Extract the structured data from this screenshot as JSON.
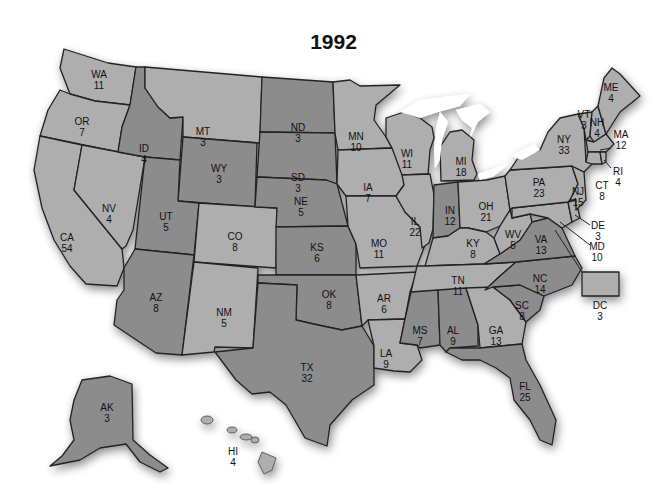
{
  "title": "1992",
  "colors": {
    "dark": "#8c8c8c",
    "light": "#aeaeae",
    "border": "#222222",
    "lakes": "#ffffff"
  },
  "states": [
    {
      "abbr": "WA",
      "votes": "11",
      "shade": "light",
      "x": 99,
      "y": 80
    },
    {
      "abbr": "OR",
      "votes": "7",
      "shade": "light",
      "x": 82,
      "y": 127
    },
    {
      "abbr": "CA",
      "votes": "54",
      "shade": "light",
      "x": 67,
      "y": 243
    },
    {
      "abbr": "NV",
      "votes": "4",
      "shade": "light",
      "x": 109,
      "y": 214
    },
    {
      "abbr": "ID",
      "votes": "4",
      "shade": "dark",
      "x": 144,
      "y": 154
    },
    {
      "abbr": "MT",
      "votes": "3",
      "shade": "light",
      "x": 203,
      "y": 137
    },
    {
      "abbr": "WY",
      "votes": "3",
      "shade": "dark",
      "x": 219,
      "y": 174
    },
    {
      "abbr": "UT",
      "votes": "5",
      "shade": "dark",
      "x": 166,
      "y": 222
    },
    {
      "abbr": "CO",
      "votes": "8",
      "shade": "light",
      "x": 235,
      "y": 242
    },
    {
      "abbr": "AZ",
      "votes": "8",
      "shade": "dark",
      "x": 156,
      "y": 303
    },
    {
      "abbr": "NM",
      "votes": "5",
      "shade": "light",
      "x": 224,
      "y": 318
    },
    {
      "abbr": "ND",
      "votes": "3",
      "shade": "dark",
      "x": 298,
      "y": 133
    },
    {
      "abbr": "SD",
      "votes": "3",
      "shade": "dark",
      "x": 298,
      "y": 183
    },
    {
      "abbr": "NE",
      "votes": "5",
      "shade": "dark",
      "x": 301,
      "y": 207
    },
    {
      "abbr": "KS",
      "votes": "6",
      "shade": "dark",
      "x": 317,
      "y": 253
    },
    {
      "abbr": "OK",
      "votes": "8",
      "shade": "dark",
      "x": 329,
      "y": 300
    },
    {
      "abbr": "TX",
      "votes": "32",
      "shade": "dark",
      "x": 307,
      "y": 373
    },
    {
      "abbr": "MN",
      "votes": "10",
      "shade": "light",
      "x": 356,
      "y": 142
    },
    {
      "abbr": "IA",
      "votes": "7",
      "shade": "light",
      "x": 368,
      "y": 193
    },
    {
      "abbr": "MO",
      "votes": "11",
      "shade": "light",
      "x": 379,
      "y": 249
    },
    {
      "abbr": "AR",
      "votes": "6",
      "shade": "light",
      "x": 384,
      "y": 304
    },
    {
      "abbr": "LA",
      "votes": "9",
      "shade": "light",
      "x": 386,
      "y": 359
    },
    {
      "abbr": "WI",
      "votes": "11",
      "shade": "light",
      "x": 407,
      "y": 159
    },
    {
      "abbr": "IL",
      "votes": "22",
      "shade": "light",
      "x": 415,
      "y": 227
    },
    {
      "abbr": "MI",
      "votes": "18",
      "shade": "light",
      "x": 461,
      "y": 167
    },
    {
      "abbr": "IN",
      "votes": "12",
      "shade": "dark",
      "x": 450,
      "y": 216
    },
    {
      "abbr": "OH",
      "votes": "21",
      "shade": "light",
      "x": 486,
      "y": 212
    },
    {
      "abbr": "KY",
      "votes": "8",
      "shade": "light",
      "x": 473,
      "y": 249
    },
    {
      "abbr": "TN",
      "votes": "11",
      "shade": "light",
      "x": 458,
      "y": 286
    },
    {
      "abbr": "MS",
      "votes": "7",
      "shade": "dark",
      "x": 420,
      "y": 336
    },
    {
      "abbr": "AL",
      "votes": "9",
      "shade": "dark",
      "x": 453,
      "y": 336
    },
    {
      "abbr": "GA",
      "votes": "13",
      "shade": "light",
      "x": 496,
      "y": 336
    },
    {
      "abbr": "FL",
      "votes": "25",
      "shade": "dark",
      "x": 525,
      "y": 392
    },
    {
      "abbr": "SC",
      "votes": "8",
      "shade": "dark",
      "x": 522,
      "y": 311
    },
    {
      "abbr": "NC",
      "votes": "14",
      "shade": "dark",
      "x": 540,
      "y": 284
    },
    {
      "abbr": "VA",
      "votes": "13",
      "shade": "dark",
      "x": 541,
      "y": 245
    },
    {
      "abbr": "WV",
      "votes": "5",
      "shade": "light",
      "x": 513,
      "y": 240
    },
    {
      "abbr": "PA",
      "votes": "23",
      "shade": "light",
      "x": 539,
      "y": 188
    },
    {
      "abbr": "NY",
      "votes": "33",
      "shade": "light",
      "x": 564,
      "y": 145
    },
    {
      "abbr": "NJ",
      "votes": "15",
      "shade": "light",
      "x": 578,
      "y": 197
    },
    {
      "abbr": "DE",
      "votes": "3",
      "shade": "light",
      "x": 598,
      "y": 231
    },
    {
      "abbr": "MD",
      "votes": "10",
      "shade": "light",
      "x": 597,
      "y": 252
    },
    {
      "abbr": "DC",
      "votes": "3",
      "shade": "light",
      "x": 600,
      "y": 311
    },
    {
      "abbr": "VT",
      "votes": "3",
      "shade": "light",
      "x": 584,
      "y": 120
    },
    {
      "abbr": "NH",
      "votes": "4",
      "shade": "light",
      "x": 597,
      "y": 128
    },
    {
      "abbr": "ME",
      "votes": "4",
      "shade": "light",
      "x": 611,
      "y": 93
    },
    {
      "abbr": "MA",
      "votes": "12",
      "shade": "light",
      "x": 621,
      "y": 140
    },
    {
      "abbr": "RI",
      "votes": "4",
      "shade": "light",
      "x": 618,
      "y": 177
    },
    {
      "abbr": "CT",
      "votes": "8",
      "shade": "light",
      "x": 602,
      "y": 191
    },
    {
      "abbr": "AK",
      "votes": "3",
      "shade": "dark",
      "x": 107,
      "y": 413
    },
    {
      "abbr": "HI",
      "votes": "4",
      "shade": "light",
      "x": 233,
      "y": 457
    }
  ]
}
